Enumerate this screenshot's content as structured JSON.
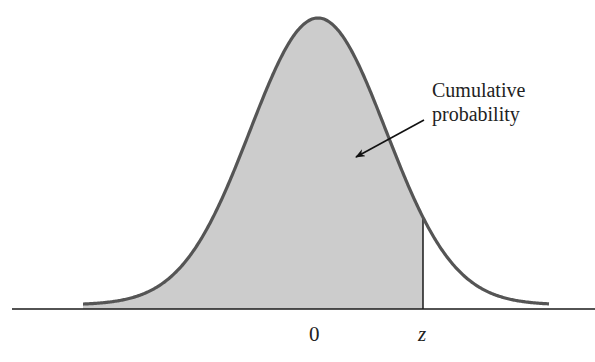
{
  "diagram": {
    "annotation": {
      "line1": "Cumulative",
      "line2": "probability"
    },
    "axis_ticks": {
      "mean": "0",
      "z": "z"
    },
    "colors": {
      "fill": "#cccccc",
      "curve": "#555555",
      "axis": "#1a1a1a",
      "text": "#222222"
    }
  },
  "chart_data": {
    "type": "area",
    "title": "",
    "xlabel": "",
    "ylabel": "",
    "tick_labels": [
      "0",
      "z"
    ],
    "shaded_region": {
      "from": "-inf",
      "to": "z"
    },
    "annotations": [
      "Cumulative probability"
    ],
    "grid": false,
    "legend": null
  }
}
